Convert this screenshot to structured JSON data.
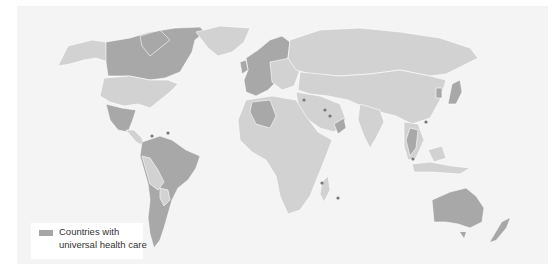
{
  "legend": {
    "swatch_color": "#a6a6a6",
    "label_line1": "Countries with",
    "label_line2": "universal health care"
  },
  "colors": {
    "background": "#f4f4f4",
    "ocean": "#f3f3f3",
    "land_other": "#d2d2d2",
    "land_universal": "#a8a8a8",
    "border": "#ffffff",
    "frame": "#9a9a9a",
    "dot": "#777777"
  },
  "map": {
    "title": "World map of countries with universal health care",
    "highlighted_regions": [
      "Canada",
      "Mexico",
      "Western Europe",
      "Scandinavia",
      "Russia",
      "Algeria",
      "Brazil",
      "Argentina",
      "Chile",
      "Venezuela",
      "Colombia",
      "Australia",
      "New Zealand",
      "Japan",
      "South Korea",
      "Thailand",
      "Malaysia",
      "Oman",
      "Kuwait",
      "Bahrain",
      "Israel",
      "Cuba",
      "Trinidad",
      "Mauritius",
      "Seychelles"
    ]
  }
}
